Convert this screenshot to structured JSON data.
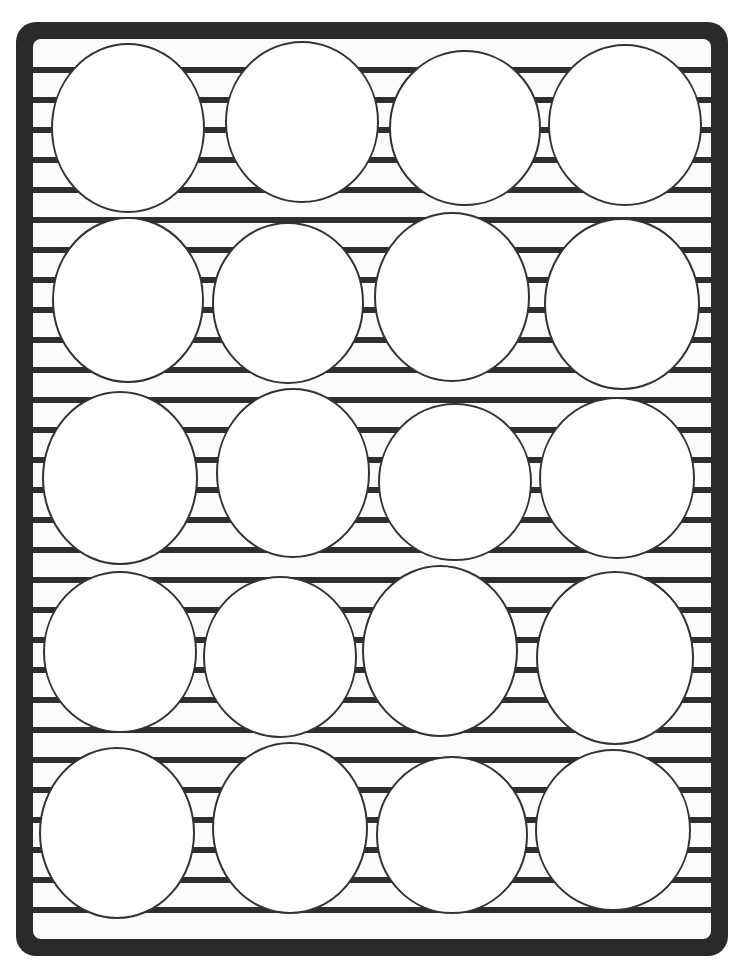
{
  "page": {
    "title": ""
  },
  "colors": {
    "background": "#ffffff",
    "frame": "#2a2a2a",
    "frame_inner": "#fbfbfb",
    "stripe": "#2e2e2e",
    "circle_fill": "#ffffff",
    "circle_stroke": "#333333"
  },
  "frame": {
    "outer": {
      "x": 16,
      "y": 22,
      "width": 712,
      "height": 934,
      "radius": 20
    },
    "inner": {
      "x": 33,
      "y": 39,
      "width": 678,
      "height": 900,
      "radius": 8
    }
  },
  "stripes": {
    "x": 33,
    "width": 678,
    "thickness": 6,
    "start_y": 67,
    "spacing": 30,
    "count": 29
  },
  "circles": {
    "rows": 5,
    "columns": 4,
    "items": [
      {
        "cx": 128,
        "cy": 128,
        "rx": 76,
        "ry": 84
      },
      {
        "cx": 302,
        "cy": 122,
        "rx": 76,
        "ry": 80
      },
      {
        "cx": 465,
        "cy": 128,
        "rx": 75,
        "ry": 77
      },
      {
        "cx": 625,
        "cy": 125,
        "rx": 76,
        "ry": 80
      },
      {
        "cx": 128,
        "cy": 300,
        "rx": 75,
        "ry": 82
      },
      {
        "cx": 288,
        "cy": 303,
        "rx": 75,
        "ry": 80
      },
      {
        "cx": 452,
        "cy": 297,
        "rx": 77,
        "ry": 84
      },
      {
        "cx": 622,
        "cy": 304,
        "rx": 77,
        "ry": 85
      },
      {
        "cx": 120,
        "cy": 478,
        "rx": 77,
        "ry": 86
      },
      {
        "cx": 293,
        "cy": 473,
        "rx": 76,
        "ry": 84
      },
      {
        "cx": 455,
        "cy": 482,
        "rx": 76,
        "ry": 78
      },
      {
        "cx": 617,
        "cy": 478,
        "rx": 77,
        "ry": 80
      },
      {
        "cx": 120,
        "cy": 652,
        "rx": 76,
        "ry": 80
      },
      {
        "cx": 280,
        "cy": 657,
        "rx": 76,
        "ry": 80
      },
      {
        "cx": 440,
        "cy": 651,
        "rx": 77,
        "ry": 85
      },
      {
        "cx": 615,
        "cy": 658,
        "rx": 78,
        "ry": 86
      },
      {
        "cx": 117,
        "cy": 833,
        "rx": 77,
        "ry": 85
      },
      {
        "cx": 290,
        "cy": 828,
        "rx": 77,
        "ry": 85
      },
      {
        "cx": 452,
        "cy": 835,
        "rx": 75,
        "ry": 78
      },
      {
        "cx": 613,
        "cy": 830,
        "rx": 77,
        "ry": 80
      }
    ]
  }
}
